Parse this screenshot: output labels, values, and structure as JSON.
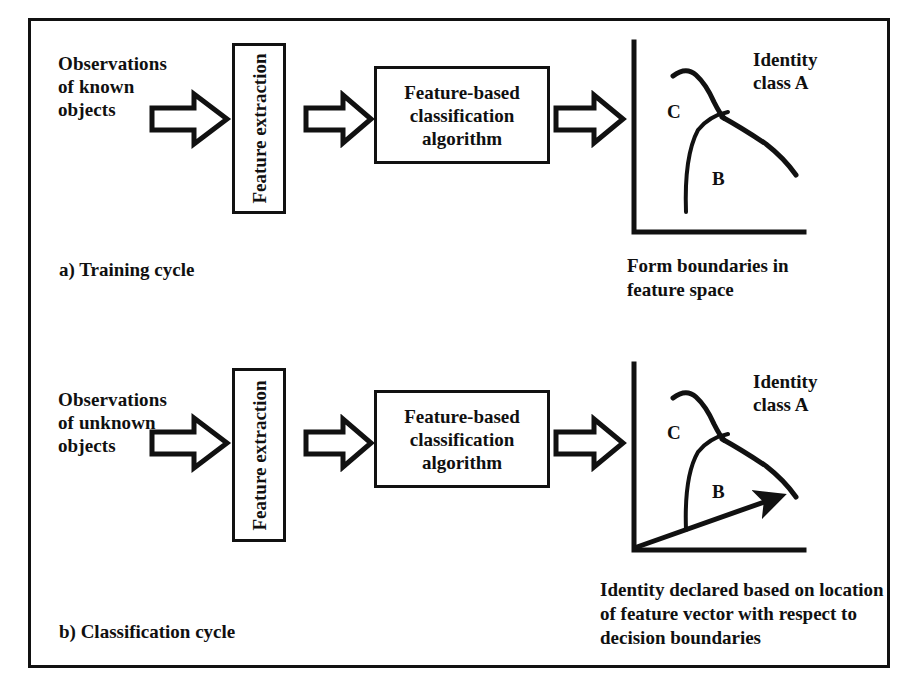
{
  "figure": {
    "border_color": "#111111",
    "background": "#ffffff",
    "ink_color": "#101010"
  },
  "rows": [
    {
      "id": "training",
      "input_label": "Observations\nof known\nobjects",
      "feature_box_label": "Feature extraction",
      "classifier_box_label": "Feature-based\nclassification\nalgorithm",
      "arrow_1": "block-arrow-right-icon",
      "arrow_2": "block-arrow-right-icon",
      "arrow_3": "block-arrow-right-icon",
      "plot": {
        "identity_label": "Identity\nclass A",
        "region_label_c": "C",
        "region_label_b": "B",
        "has_feature_vector": false
      },
      "output_caption": "Form boundaries in\nfeature space",
      "cycle_caption": "a) Training cycle"
    },
    {
      "id": "classification",
      "input_label": "Observations\nof unknown\nobjects",
      "feature_box_label": "Feature extraction",
      "classifier_box_label": "Feature-based\nclassification\nalgorithm",
      "arrow_1": "block-arrow-right-icon",
      "arrow_2": "block-arrow-right-icon",
      "arrow_3": "block-arrow-right-icon",
      "plot": {
        "identity_label": "Identity\nclass A",
        "region_label_c": "C",
        "region_label_b": "B",
        "has_feature_vector": true
      },
      "output_caption": "Identity declared based on location\nof feature vector with respect to\ndecision boundaries",
      "cycle_caption": "b) Classification cycle"
    }
  ]
}
